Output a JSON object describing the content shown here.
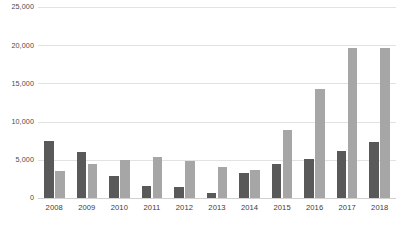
{
  "chart_data": {
    "type": "bar",
    "title": "",
    "subtitle": "",
    "xlabel": "",
    "ylabel": "",
    "ylim": [
      0,
      25000
    ],
    "ytick_values": [
      0,
      5000,
      10000,
      15000,
      20000,
      25000
    ],
    "ytick_labels": [
      "0",
      "5,000",
      "10,000",
      "15,000",
      "20,000",
      "25,000"
    ],
    "grid": true,
    "legend": "none",
    "categories": [
      "2008",
      "2009",
      "2010",
      "2011",
      "2012",
      "2013",
      "2014",
      "2015",
      "2016",
      "2017",
      "2018"
    ],
    "series": [
      {
        "name": "series-1",
        "color": "#595959",
        "values": [
          7500,
          6000,
          2900,
          1600,
          1400,
          700,
          3300,
          4500,
          5100,
          6200,
          7300
        ]
      },
      {
        "name": "series-2",
        "color": "#a6a6a6",
        "values": [
          3600,
          4400,
          5000,
          5400,
          4800,
          4000,
          3700,
          8900,
          14300,
          19700,
          19700
        ]
      }
    ]
  },
  "footer": {
    "caption": ""
  }
}
